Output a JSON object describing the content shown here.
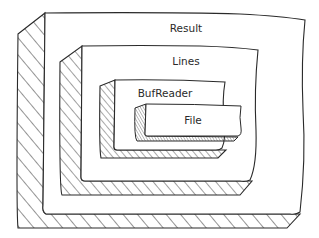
{
  "diagram": {
    "type": "nested-boxes",
    "layers": [
      {
        "id": "result",
        "label": "Result"
      },
      {
        "id": "lines",
        "label": "Lines"
      },
      {
        "id": "bufreader",
        "label": "BufReader"
      },
      {
        "id": "file",
        "label": "File"
      }
    ],
    "colors": {
      "stroke": "#2a2a2a",
      "fill": "#ffffff",
      "hatch": "#2a2a2a"
    }
  }
}
